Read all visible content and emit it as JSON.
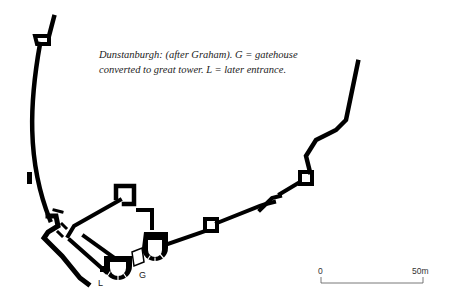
{
  "caption": {
    "line1": "Dunstanburgh: (after Graham). G = gatehouse",
    "line2": "converted to great tower. L = later entrance."
  },
  "labels": {
    "gatehouse": "G",
    "later_entrance": "L"
  },
  "scale_bar": {
    "start_label": "0",
    "end_label": "50m",
    "color": "#555555"
  },
  "plan": {
    "wall_color": "#000000",
    "background": "#ffffff"
  }
}
